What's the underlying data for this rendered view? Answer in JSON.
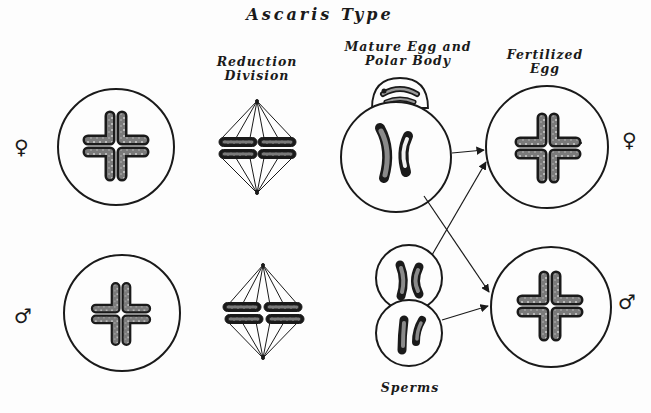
{
  "title": "Ascaris Type",
  "labels": {
    "reduction_division": [
      "Reduction",
      "Division"
    ],
    "mature_egg": [
      "Mature Egg and",
      "Polar Body"
    ],
    "fertilized_egg": [
      "Fertilized",
      "Egg"
    ],
    "sperms": "Sperms"
  },
  "sex_symbols": {
    "female": "♀",
    "male": "♂"
  },
  "rows": [
    {
      "sex": "female",
      "stages": [
        "Oocyte (4 chromosomes)",
        "Reduction spindle",
        "Mature egg with polar body (2 chromosomes)",
        "Fertilized egg (4 chromosomes)"
      ]
    },
    {
      "sex": "male",
      "stages": [
        "Spermatocyte (4 chromosomes)",
        "Reduction spindle",
        "Sperms (2 chromosomes each)",
        "Fertilized egg (4 chromosomes)"
      ]
    }
  ],
  "colors": {
    "ink": "#1a1a1a",
    "chromosome_fill": "#8a8a8a",
    "paper": "#fdfdfd"
  }
}
